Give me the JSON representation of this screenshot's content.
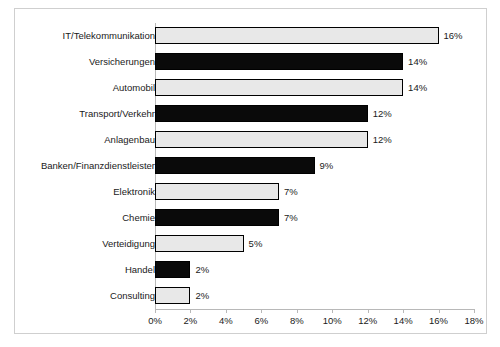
{
  "chart_data": {
    "type": "bar",
    "orientation": "horizontal",
    "title": "",
    "xlabel": "",
    "ylabel": "",
    "xlim": [
      0,
      18
    ],
    "xtick_step": 2,
    "grid": false,
    "legend": null,
    "xticks": [
      "0%",
      "2%",
      "4%",
      "6%",
      "8%",
      "10%",
      "12%",
      "14%",
      "16%",
      "18%"
    ],
    "categories": [
      "IT/Telekommunikation",
      "Versicherungen",
      "Automobil",
      "Transport/Verkehr",
      "Anlagenbau",
      "Banken/Finanzdienstleister",
      "Elektronik",
      "Chemie",
      "Verteidigung",
      "Handel",
      "Consulting"
    ],
    "values": [
      16,
      14,
      14,
      12,
      12,
      9,
      7,
      7,
      5,
      2,
      2
    ],
    "value_labels": [
      "16%",
      "14%",
      "14%",
      "12%",
      "12%",
      "9%",
      "7%",
      "7%",
      "5%",
      "2%",
      "2%"
    ],
    "bar_styles": [
      "light",
      "dark",
      "light",
      "dark",
      "light",
      "dark",
      "light",
      "dark",
      "light",
      "dark",
      "light"
    ],
    "colors": {
      "light_bar": "#e8e8e8",
      "dark_bar": "#0a0a0a",
      "bar_border": "#000000",
      "axis": "#b8b8b8",
      "frame": "#cfcfcf",
      "text": "#1a1a1a",
      "background": "#ffffff"
    }
  }
}
